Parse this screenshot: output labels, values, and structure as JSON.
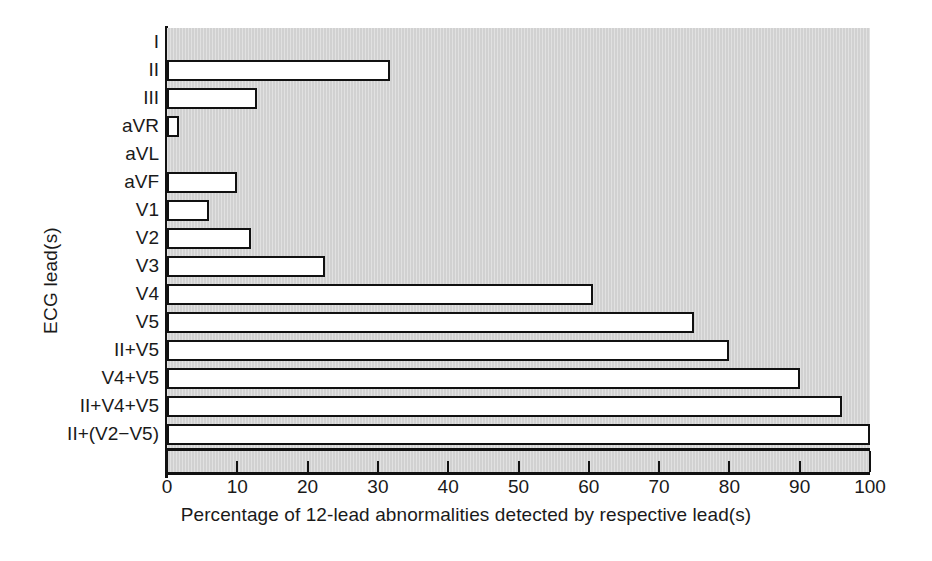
{
  "chart_data": {
    "type": "bar",
    "orientation": "horizontal",
    "title": "",
    "xlabel": "Percentage of 12-lead abnormalities detected by respective lead(s)",
    "ylabel": "ECG lead(s)",
    "categories": [
      "I",
      "II",
      "III",
      "aVR",
      "aVL",
      "aVF",
      "V1",
      "V2",
      "V3",
      "V4",
      "V5",
      "II+V5",
      "V4+V5",
      "II+V4+V5",
      "II+(V2−V5)"
    ],
    "values": [
      0,
      31.7,
      12.8,
      1.7,
      0,
      10,
      6,
      12,
      22.5,
      60.6,
      75,
      80,
      90,
      96,
      100
    ],
    "xlim": [
      0,
      100
    ],
    "xticks": [
      0,
      10,
      20,
      30,
      40,
      50,
      60,
      70,
      80,
      90,
      100
    ],
    "xticklabels": [
      "0",
      "10",
      "20",
      "30",
      "40",
      "50",
      "60",
      "70",
      "80",
      "90",
      "100"
    ],
    "grid": false,
    "legend": null,
    "plot_background_color": "#d4d4d4",
    "bar_fill_color": "#ffffff",
    "bar_edge_color": "#111111",
    "figure_background_color": "#ffffff"
  }
}
